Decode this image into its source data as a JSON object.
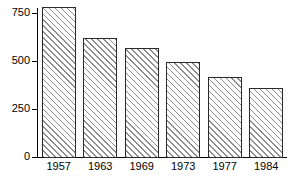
{
  "chart_data": {
    "type": "bar",
    "title": "",
    "subtitle": "",
    "xlabel": "",
    "ylabel": "",
    "categories": [
      "1957",
      "1963",
      "1969",
      "1973",
      "1977",
      "1984"
    ],
    "values": [
      780,
      620,
      570,
      495,
      415,
      360
    ],
    "ylim": [
      0,
      800
    ],
    "yticks": [
      0,
      250,
      500,
      750
    ],
    "ytick_labels": [
      "0",
      "250",
      "500",
      "750"
    ],
    "xtick_labels": [
      "1957",
      "1963",
      "1969",
      "1973",
      "1977",
      "1984"
    ],
    "grid": false,
    "legend": null,
    "legend_position": "none",
    "series": [
      {
        "name": "",
        "values": [
          780,
          620,
          570,
          495,
          415,
          360
        ]
      }
    ],
    "annotations": [],
    "style": {
      "bar_fill": "#ffffff",
      "bar_hatch": "/",
      "bar_hatch_color": "#8d8d8d",
      "bar_edge_color": "#2b2b2b",
      "axis_color": "#000000",
      "background": "#ffffff"
    }
  }
}
